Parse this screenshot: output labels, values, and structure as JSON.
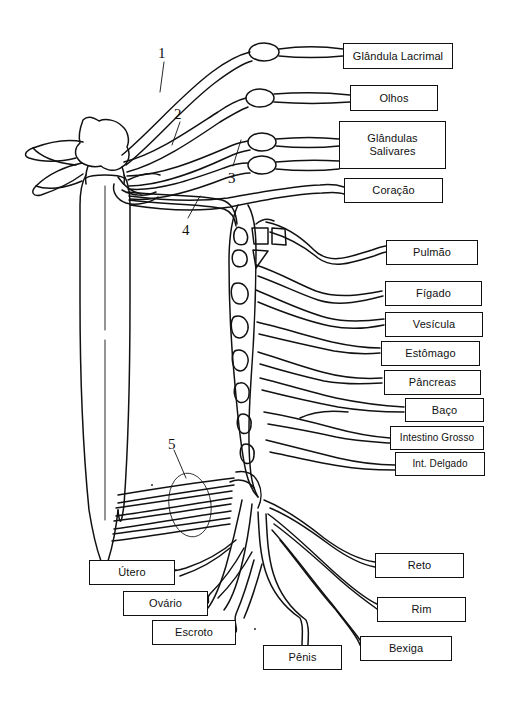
{
  "figure": {
    "language": "pt-BR",
    "background_color": "#ffffff",
    "line_color": "#111111",
    "box_border_color": "#111111",
    "box_fill_color": "#ffffff",
    "text_color": "#111111"
  },
  "callouts": [
    {
      "id": "callout-1",
      "text": "1",
      "x": 158,
      "y": 46
    },
    {
      "id": "callout-2",
      "text": "2",
      "x": 174,
      "y": 107
    },
    {
      "id": "callout-3",
      "text": "3",
      "x": 228,
      "y": 171
    },
    {
      "id": "callout-4",
      "text": "4",
      "x": 182,
      "y": 223
    },
    {
      "id": "callout-5",
      "text": "5",
      "x": 168,
      "y": 437
    }
  ],
  "labels": [
    {
      "id": "glandula-lacrimal",
      "text": "Glândula Lacrimal",
      "x": 343,
      "y": 43,
      "w": 110,
      "h": 26,
      "lines": 1
    },
    {
      "id": "olhos",
      "text": "Olhos",
      "x": 350,
      "y": 85,
      "w": 88,
      "h": 26,
      "lines": 1
    },
    {
      "id": "glandulas-salivares",
      "text": "Glândulas\nSalivares",
      "x": 339,
      "y": 121,
      "w": 107,
      "h": 48,
      "lines": 2
    },
    {
      "id": "coracao",
      "text": "Coração",
      "x": 344,
      "y": 178,
      "w": 99,
      "h": 25,
      "lines": 1
    },
    {
      "id": "pulmao",
      "text": "Pulmão",
      "x": 386,
      "y": 240,
      "w": 92,
      "h": 25,
      "lines": 1
    },
    {
      "id": "figado",
      "text": "Fígado",
      "x": 385,
      "y": 281,
      "w": 97,
      "h": 25,
      "lines": 1
    },
    {
      "id": "vesicula",
      "text": "Vesícula",
      "x": 385,
      "y": 312,
      "w": 98,
      "h": 25,
      "lines": 1
    },
    {
      "id": "estomago",
      "text": "Estômago",
      "x": 381,
      "y": 341,
      "w": 99,
      "h": 25,
      "lines": 1
    },
    {
      "id": "pancreas",
      "text": "Pâncreas",
      "x": 384,
      "y": 370,
      "w": 97,
      "h": 25,
      "lines": 1
    },
    {
      "id": "baco",
      "text": "Baço",
      "x": 405,
      "y": 398,
      "w": 79,
      "h": 24,
      "lines": 1
    },
    {
      "id": "intestino-grosso",
      "text": "Intestino Grosso",
      "x": 390,
      "y": 426,
      "w": 94,
      "h": 24,
      "lines": 1
    },
    {
      "id": "int-delgado",
      "text": "Int. Delgado",
      "x": 395,
      "y": 452,
      "w": 90,
      "h": 24,
      "lines": 1
    },
    {
      "id": "utero",
      "text": "Útero",
      "x": 89,
      "y": 560,
      "w": 86,
      "h": 25,
      "lines": 1
    },
    {
      "id": "ovario",
      "text": "Ovário",
      "x": 123,
      "y": 591,
      "w": 85,
      "h": 25,
      "lines": 1
    },
    {
      "id": "escroto",
      "text": "Escroto",
      "x": 152,
      "y": 620,
      "w": 84,
      "h": 25,
      "lines": 1
    },
    {
      "id": "penis",
      "text": "Pênis",
      "x": 263,
      "y": 645,
      "w": 79,
      "h": 25,
      "lines": 1
    },
    {
      "id": "reto",
      "text": "Reto",
      "x": 375,
      "y": 553,
      "w": 89,
      "h": 25,
      "lines": 1
    },
    {
      "id": "rim",
      "text": "Rim",
      "x": 377,
      "y": 597,
      "w": 89,
      "h": 25,
      "lines": 1
    },
    {
      "id": "bexiga",
      "text": "Bexiga",
      "x": 360,
      "y": 636,
      "w": 92,
      "h": 25,
      "lines": 1
    }
  ]
}
